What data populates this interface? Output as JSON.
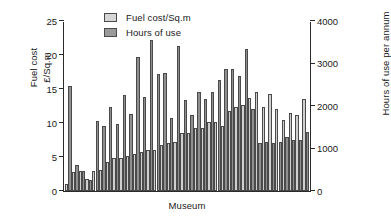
{
  "chart_data": {
    "type": "bar",
    "title": "",
    "xlabel": "Museum",
    "ylabel": "Fuel cost £/Sq.m",
    "ylabel_lines": [
      "Fuel cost",
      "£/Sq.m"
    ],
    "ylabel_right": "Hours of use per annum",
    "grid": false,
    "legend_position": "top-left-inside",
    "ylim": [
      0,
      25
    ],
    "y2lim": [
      0,
      4000
    ],
    "yticks": [
      0,
      5,
      10,
      15,
      20,
      25
    ],
    "yticklabels": [
      "0",
      "5",
      "10",
      "15",
      "20",
      "25"
    ],
    "y2ticks": [
      0,
      1000,
      2000,
      3000,
      4000
    ],
    "y2ticklabels": [
      "0",
      "1000",
      "2000",
      "3000",
      "4000"
    ],
    "xticklabels": [],
    "legend": [
      "Fuel cost/Sq.m",
      "Hours of use"
    ],
    "colors": {
      "fuel": "#cfcfcf",
      "hours": "#8f8f8f",
      "edge": "#4a4a4a",
      "axis": "#2a2a2a",
      "background": "#ffffff"
    },
    "categories": [
      "1",
      "2",
      "3",
      "4",
      "5",
      "6",
      "7",
      "8",
      "9",
      "10",
      "11",
      "12",
      "13",
      "14",
      "15",
      "16",
      "17",
      "18",
      "19",
      "20",
      "21",
      "22",
      "23",
      "24",
      "25",
      "26",
      "27",
      "28",
      "29",
      "30",
      "31",
      "32",
      "33",
      "34",
      "35",
      "36"
    ],
    "series": [
      {
        "name": "Fuel cost/Sq.m",
        "axis": "left",
        "unit": "£/Sq.m",
        "values": [
          1.0,
          2.8,
          2.9,
          1.7,
          2.9,
          3.1,
          4.2,
          4.9,
          4.9,
          5.2,
          5.4,
          5.8,
          6.0,
          6.0,
          6.7,
          7.0,
          7.2,
          8.5,
          8.5,
          9.3,
          9.3,
          10.2,
          10.2,
          9.5,
          11.8,
          12.3,
          12.6,
          13.7,
          14.6,
          12.3,
          14.2,
          12.1,
          10.4,
          11.4,
          11.2,
          13.5
        ]
      },
      {
        "name": "Hours of use",
        "axis": "right",
        "unit": "hours per annum",
        "values": [
          2460,
          620,
          470,
          250,
          1640,
          1540,
          1970,
          1580,
          2250,
          1820,
          3160,
          2210,
          3560,
          2760,
          2770,
          1710,
          3420,
          2130,
          1790,
          2320,
          2160,
          2320,
          2620,
          2880,
          2860,
          2700,
          3340,
          1940,
          1120,
          1160,
          1140,
          1160,
          1260,
          1210,
          1190,
          1380
        ]
      }
    ]
  }
}
